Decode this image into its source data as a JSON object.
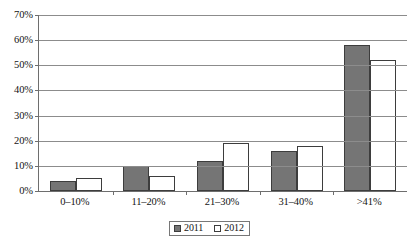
{
  "chart_data": {
    "type": "bar",
    "title": "",
    "subtitle": "",
    "xlabel": "",
    "ylabel": "",
    "categories": [
      "0–10%",
      "11–20%",
      "21–30%",
      "31–40%",
      ">41%"
    ],
    "series": [
      {
        "name": "2011",
        "values": [
          4,
          10,
          12,
          16,
          58
        ],
        "color": "#757575"
      },
      {
        "name": "2012",
        "values": [
          5,
          6,
          19,
          18,
          52
        ],
        "color": "#ffffff"
      }
    ],
    "ylim": [
      0,
      70
    ],
    "y_ticks": [
      0,
      10,
      20,
      30,
      40,
      50,
      60,
      70
    ],
    "y_tick_labels": [
      "0%",
      "10%",
      "20%",
      "30%",
      "40%",
      "50%",
      "60%",
      "70%"
    ],
    "grid": true,
    "grid_axis": "y",
    "legend_position": "bottom-center",
    "legend_entries": [
      "2011",
      "2012"
    ],
    "value_unit": "%"
  }
}
